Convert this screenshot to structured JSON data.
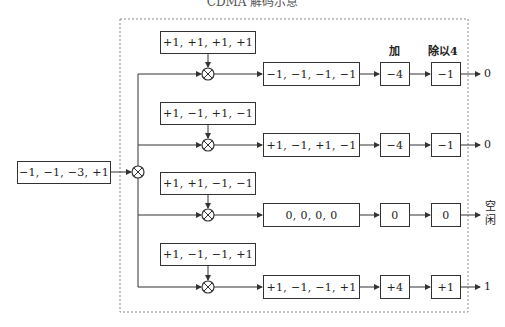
{
  "title": "CDMA 解码示意",
  "input": {
    "value": "−1, −1, −3, +1"
  },
  "headers": {
    "sum": "加",
    "divide": "除以4"
  },
  "rows": [
    {
      "code": "+1, +1, +1, +1",
      "product": "−1, −1, −1, −1",
      "sum": "−4",
      "divided": "−1",
      "output": "0"
    },
    {
      "code": "+1, −1, +1, −1",
      "product": "+1, −1, +1, −1",
      "sum": "−4",
      "divided": "−1",
      "output": "0"
    },
    {
      "code": "+1, +1, −1, −1",
      "product": "0, 0, 0, 0",
      "sum": "0",
      "divided": "0",
      "output_line1": "空",
      "output_line2": "闲"
    },
    {
      "code": "+1, −1, −1, +1",
      "product": "+1, −1, −1, +1",
      "sum": "+4",
      "divided": "+1",
      "output": "1"
    }
  ],
  "colors": {
    "line": "#333333",
    "dashed_border": "#888888"
  }
}
